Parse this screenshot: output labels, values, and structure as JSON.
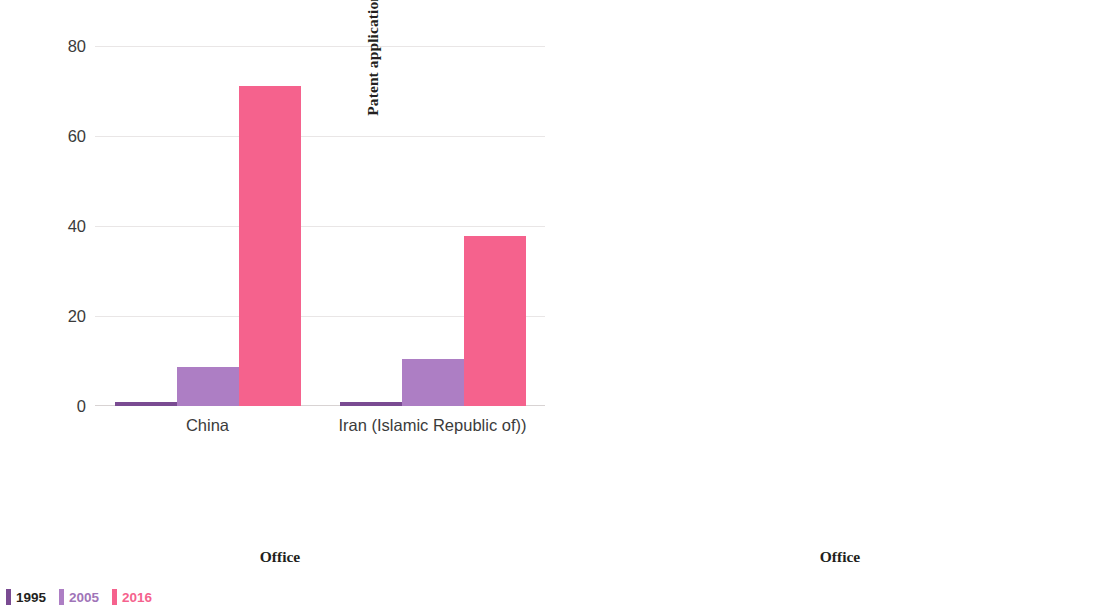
{
  "charts": [
    {
      "id": "left",
      "ylabel": "Patent applications (1995 = 1)",
      "xlabel": "Office",
      "yticks": [
        "0",
        "20",
        "40",
        "60",
        "80"
      ],
      "legend": [
        {
          "label": "1995",
          "color": "#7a4b92"
        },
        {
          "label": "2005",
          "color": "#ad7ec4"
        },
        {
          "label": "2016",
          "color": "#f5628d"
        }
      ]
    },
    {
      "id": "right",
      "ylabel": "Patent applications (1995 = 1)",
      "xlabel": "Office",
      "yticks": [
        "0",
        "2",
        "4",
        "6",
        "8"
      ],
      "legend": [
        {
          "label": "1995",
          "color": "#7a4b92"
        },
        {
          "label": "2005",
          "color": "#ad7ec4"
        },
        {
          "label": "2016",
          "color": "#f5628d"
        }
      ]
    }
  ],
  "chart_data": [
    {
      "type": "bar",
      "title": "",
      "xlabel": "Office",
      "ylabel": "Patent applications (1995 = 1)",
      "categories": [
        "China",
        "Iran (Islamic Republic of))"
      ],
      "series": [
        {
          "name": "1995",
          "color": "#7a4b92",
          "values": [
            1,
            1
          ]
        },
        {
          "name": "2005",
          "color": "#ad7ec4",
          "values": [
            8.7,
            10.4
          ]
        },
        {
          "name": "2016",
          "color": "#f5628d",
          "values": [
            71.2,
            37.7
          ]
        }
      ],
      "ylim": [
        0,
        84
      ],
      "yticks": [
        0,
        20,
        40,
        60,
        80
      ],
      "grid": true,
      "legend_position": "bottom-left",
      "tick_label_rotation": 0
    },
    {
      "type": "bar",
      "title": "",
      "xlabel": "Office",
      "ylabel": "Patent applications (1995 = 1)",
      "categories": [
        "India",
        "Brazil",
        "Mexico",
        "Rep. of Korea",
        "U.S.",
        "EPO",
        "Australia",
        "Russian Federation",
        "Germany",
        "Canada",
        "Japan"
      ],
      "series": [
        {
          "name": "1995",
          "color": "#7a4b92",
          "values": [
            1,
            1,
            1,
            1,
            1,
            1,
            1,
            1,
            1,
            1,
            1
          ]
        },
        {
          "name": "2005",
          "color": "#ad7ec4",
          "values": [
            3.8,
            2.6,
            2.8,
            2.2,
            1.85,
            2.25,
            1.8,
            1.45,
            1.45,
            1.45,
            1.15
          ]
        },
        {
          "name": "2016",
          "color": "#f5628d",
          "values": [
            6.85,
            3.9,
            3.3,
            2.75,
            2.75,
            2.75,
            2.15,
            1.8,
            1.55,
            1.45,
            1.25
          ]
        }
      ],
      "ylim": [
        0,
        8.4
      ],
      "yticks": [
        0,
        2,
        4,
        6,
        8
      ],
      "grid": true,
      "legend_position": "bottom-left",
      "tick_label_rotation": 45
    }
  ]
}
